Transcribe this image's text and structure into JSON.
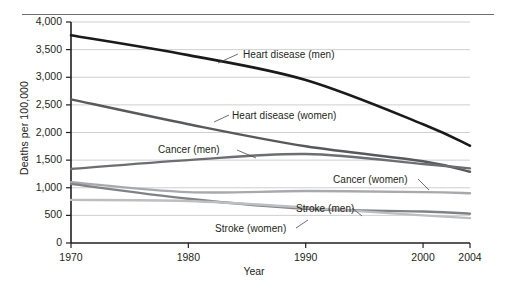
{
  "chart_data": {
    "type": "line",
    "title": "",
    "xlabel": "Year",
    "ylabel": "Deaths per 100,000",
    "x": [
      1970,
      1980,
      1990,
      2000,
      2004
    ],
    "xlim": [
      1970,
      2004
    ],
    "ylim": [
      0,
      4000
    ],
    "grid": true,
    "legend_position": "inline-annotations",
    "xticks": [
      "1970",
      "1980",
      "1990",
      "2000",
      "2004"
    ],
    "yticks": [
      "0",
      "500",
      "1,000",
      "1,500",
      "2,000",
      "2,500",
      "3,000",
      "3,500",
      "4,000"
    ],
    "series": [
      {
        "name": "Heart disease (men)",
        "color": "#1a1a1a",
        "width": 2.6,
        "values": [
          3760,
          3400,
          2950,
          2150,
          1760
        ],
        "label": "Heart disease (men)"
      },
      {
        "name": "Heart disease (women)",
        "color": "#58595b",
        "width": 2.4,
        "values": [
          2600,
          2150,
          1750,
          1480,
          1290
        ],
        "label": "Heart disease (women)"
      },
      {
        "name": "Cancer (men)",
        "color": "#6d6e71",
        "width": 2.4,
        "values": [
          1340,
          1500,
          1610,
          1430,
          1350
        ],
        "label": "Cancer (men)"
      },
      {
        "name": "Cancer (women)",
        "color": "#a7a9ac",
        "width": 2.4,
        "values": [
          1100,
          920,
          940,
          920,
          900
        ],
        "label": "Cancer (women)"
      },
      {
        "name": "Stroke (men)",
        "color": "#808285",
        "width": 2.4,
        "values": [
          1070,
          800,
          620,
          570,
          530
        ],
        "label": "Stroke (men)"
      },
      {
        "name": "Stroke (women)",
        "color": "#bcbec0",
        "width": 2.4,
        "values": [
          780,
          760,
          640,
          500,
          450
        ],
        "label": "Stroke (women)"
      }
    ],
    "annotations": [
      {
        "text": "Heart disease (men)",
        "x": 243,
        "y": 49
      },
      {
        "text": "Heart disease (women)",
        "x": 232,
        "y": 110
      },
      {
        "text": "Cancer (men)",
        "x": 158,
        "y": 144
      },
      {
        "text": "Cancer (women)",
        "x": 333,
        "y": 174
      },
      {
        "text": "Stroke (men)",
        "x": 296,
        "y": 203
      },
      {
        "text": "Stroke (women)",
        "x": 215,
        "y": 223
      }
    ]
  },
  "axis": {
    "y_title": "Deaths per 100,000",
    "x_title": "Year"
  }
}
